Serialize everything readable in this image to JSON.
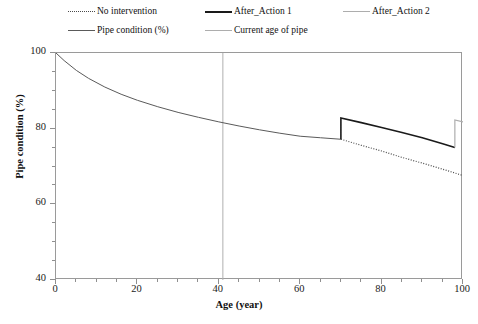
{
  "legend": {
    "entries": [
      {
        "label": "No intervention",
        "style": "dotted",
        "color": "#4a4a4a",
        "x": 68,
        "y": 6
      },
      {
        "label": "After_Action 1",
        "style": "solid-thick",
        "color": "#1a1a1a",
        "x": 205,
        "y": 6
      },
      {
        "label": "After_Action 2",
        "style": "solid-light",
        "color": "#adadad",
        "x": 343,
        "y": 6
      },
      {
        "label": "Pipe condition (%)",
        "style": "solid-mid",
        "color": "#5a5a5a",
        "x": 68,
        "y": 25
      },
      {
        "label": "Current age of pipe",
        "style": "solid-light",
        "color": "#b0b0b0",
        "x": 205,
        "y": 25
      }
    ]
  },
  "axes": {
    "xlabel": "Age (year)",
    "ylabel": "Pipe condition (%)",
    "xticks": [
      "0",
      "20",
      "40",
      "60",
      "80",
      "100"
    ],
    "yticks": [
      "100",
      "80",
      "60",
      "40"
    ]
  },
  "chart_data": {
    "type": "line",
    "title": "",
    "xlabel": "Age (year)",
    "ylabel": "Pipe condition (%)",
    "xlim": [
      0,
      100
    ],
    "ylim": [
      40,
      100
    ],
    "xticks": [
      0,
      20,
      40,
      60,
      80,
      100
    ],
    "yticks": [
      40,
      60,
      80,
      100
    ],
    "xminor_step": 5,
    "yminor_step": 5,
    "grid": false,
    "legend_position": "above-plot",
    "annotations": [
      {
        "name": "current-age-of-pipe",
        "type": "vline",
        "x": 41,
        "color": "#b0b0b0"
      },
      {
        "name": "action-1-time",
        "type": "step-up",
        "x": 70,
        "from": 77.2,
        "to": 82.8
      },
      {
        "name": "action-2-time",
        "type": "step-up",
        "x": 98,
        "from": 75.0,
        "to": 82.3
      }
    ],
    "series": [
      {
        "name": "Pipe condition (%)",
        "style": "solid",
        "color": "#5a5a5a",
        "width": 1,
        "x": [
          0,
          2,
          5,
          8,
          12,
          16,
          20,
          25,
          30,
          35,
          40,
          45,
          50,
          55,
          60,
          65,
          70
        ],
        "y": [
          100.0,
          98.0,
          95.4,
          93.3,
          91.0,
          89.1,
          87.5,
          85.8,
          84.3,
          83.0,
          81.8,
          80.7,
          79.7,
          78.8,
          78.0,
          77.6,
          77.2
        ]
      },
      {
        "name": "No intervention",
        "style": "dotted",
        "color": "#4a4a4a",
        "width": 1.2,
        "x": [
          70,
          75,
          80,
          85,
          90,
          95,
          100
        ],
        "y": [
          77.2,
          75.6,
          74.1,
          72.4,
          70.9,
          69.3,
          67.6
        ]
      },
      {
        "name": "After_Action 1",
        "style": "solid",
        "color": "#1a1a1a",
        "width": 1.6,
        "x": [
          70,
          70,
          75,
          80,
          85,
          90,
          95,
          98
        ],
        "y": [
          77.2,
          82.8,
          81.6,
          80.3,
          79.0,
          77.6,
          76.0,
          75.0
        ]
      },
      {
        "name": "After_Action 2",
        "style": "solid",
        "color": "#adadad",
        "width": 1.2,
        "x": [
          98,
          98,
          100
        ],
        "y": [
          75.0,
          82.3,
          81.8
        ]
      }
    ]
  }
}
